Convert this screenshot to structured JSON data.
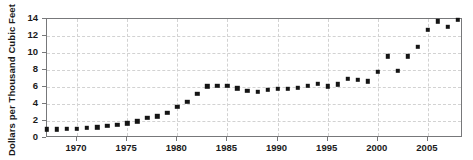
{
  "chart_data": {
    "type": "scatter",
    "title": "",
    "xlabel": "",
    "ylabel": "Dollars per Thousand Cubic Feet",
    "xlim": [
      1967,
      2008.5
    ],
    "ylim": [
      0,
      14
    ],
    "xticks": [
      1970,
      1975,
      1980,
      1985,
      1990,
      1995,
      2000,
      2005
    ],
    "yticks": [
      0,
      2,
      4,
      6,
      8,
      10,
      12,
      14
    ],
    "grid": true,
    "legend": "none",
    "marker_color": "#141414",
    "frame_color": "#77787a",
    "grid_color": "#d2d2d2",
    "x": [
      1967,
      1968,
      1969,
      1970,
      1971,
      1972,
      1973,
      1974,
      1975,
      1976,
      1977,
      1978,
      1979,
      1980,
      1981,
      1982,
      1983,
      1984,
      1985,
      1986,
      1987,
      1988,
      1989,
      1990,
      1991,
      1992,
      1993,
      1994,
      1995,
      1996,
      1997,
      1998,
      1999,
      2000,
      2001,
      2002,
      2003,
      2004,
      2005,
      2006,
      2007,
      2008
    ],
    "values": [
      1.04,
      1.04,
      1.05,
      1.09,
      1.21,
      1.28,
      1.4,
      1.54,
      1.71,
      1.98,
      2.35,
      2.56,
      2.98,
      3.68,
      4.29,
      5.17,
      6.06,
      6.12,
      6.12,
      5.83,
      5.54,
      5.47,
      5.64,
      5.8,
      5.82,
      5.89,
      6.16,
      6.41,
      6.06,
      6.34,
      6.94,
      6.82,
      6.69,
      7.76,
      9.63,
      7.89,
      9.63,
      10.75,
      12.7,
      13.75,
      13.08,
      13.89
    ],
    "values_note": "Estimated from marker positions against the axis scale"
  },
  "axis": {
    "ylabel": "Dollars per Thousand Cubic Feet",
    "ytick_labels": [
      "0",
      "2",
      "4",
      "6",
      "8",
      "10",
      "12",
      "14"
    ],
    "xtick_labels": [
      "1970",
      "1975",
      "1980",
      "1985",
      "1990",
      "1995",
      "2000",
      "2005"
    ]
  }
}
